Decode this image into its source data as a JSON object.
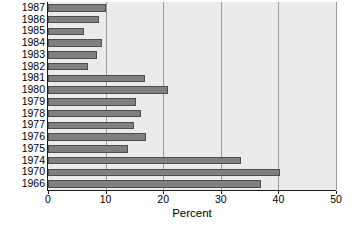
{
  "chart_data": {
    "type": "bar",
    "orientation": "horizontal",
    "title": "",
    "subtitle": "",
    "xlabel": "Percent",
    "ylabel": "",
    "xlim": [
      0,
      50
    ],
    "ylim": null,
    "xticks": [
      0,
      10,
      20,
      30,
      40,
      50
    ],
    "xtick_labels": [
      "0",
      "10",
      "20",
      "30",
      "40",
      "50"
    ],
    "grid": "vertical",
    "legend": null,
    "legend_position": "none",
    "categories": [
      "1987",
      "1986",
      "1985",
      "1984",
      "1983",
      "1982",
      "1981",
      "1980",
      "1979",
      "1978",
      "1977",
      "1976",
      "1975",
      "1974",
      "1970",
      "1966"
    ],
    "values": [
      10.1,
      8.8,
      6.3,
      9.3,
      8.5,
      7.0,
      16.9,
      20.8,
      15.2,
      16.1,
      15.0,
      17.1,
      13.9,
      33.5,
      40.3,
      37.0
    ],
    "bar_color": "#808080",
    "bar_edge_color": "#4d4d4d",
    "plot_background": "#ebebeb",
    "grid_color": "#9a9a9a",
    "axis_color": "#1a1a1a"
  },
  "axis": {
    "x_title": "Percent"
  }
}
